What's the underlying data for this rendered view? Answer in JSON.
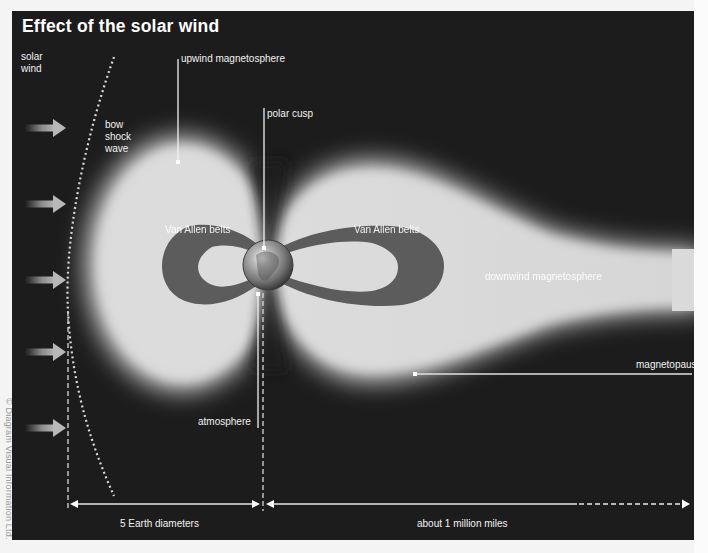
{
  "diagram": {
    "title": "Effect of the solar wind",
    "credit": "© Diagram Visual Information Ltd.",
    "colors": {
      "background": "#1c1c1c",
      "magnetosphere": "#dcdcdc",
      "van_allen_belts": "#5c5c5c",
      "text": "#f2f2f2",
      "page": "#f4f4f4"
    },
    "labels": {
      "solar_wind": "solar\nwind",
      "bow_shock_wave": "bow\nshock\nwave",
      "upwind_magnetosphere": "upwind magnetosphere",
      "polar_cusp": "polar cusp",
      "van_allen_belts_left": "Van Allen belts",
      "van_allen_belts_right": "Van Allen belts",
      "downwind_magnetosphere": "downwind magnetosphere",
      "magnetopause": "magnetopause",
      "atmosphere": "atmosphere"
    },
    "scale": {
      "left_span": "5 Earth diameters",
      "right_span": "about 1 million miles"
    },
    "solar_wind_arrows": 5,
    "nodes": [
      "solar wind",
      "bow shock wave",
      "upwind magnetosphere",
      "polar cusp",
      "Van Allen belts",
      "Earth",
      "atmosphere",
      "downwind magnetosphere",
      "magnetopause"
    ]
  }
}
